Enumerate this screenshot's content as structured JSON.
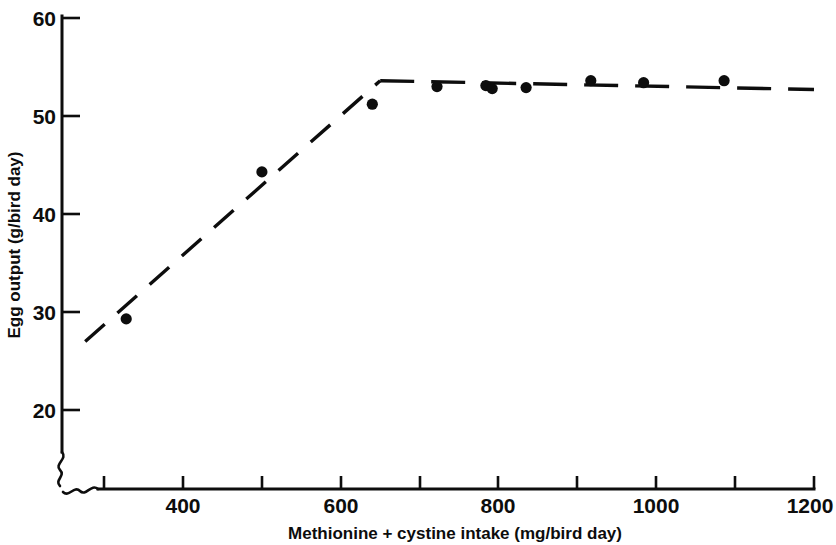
{
  "figure": {
    "title": "",
    "background_color": "#ffffff",
    "ink_color": "#0d0d0d"
  },
  "axes": {
    "x": {
      "label": "Methionine + cystine intake (mg/bird day)",
      "tick_labels": [
        "400",
        "600",
        "800",
        "1000",
        "1200"
      ],
      "labeled_ticks": [
        400,
        600,
        800,
        1000,
        1200
      ],
      "minor_ticks": [
        500,
        700,
        900,
        1100
      ],
      "range_drawn": [
        276,
        1200
      ],
      "has_axis_break": true,
      "tick_direction": "inward"
    },
    "y": {
      "label": "Egg output (g/bird day)",
      "tick_labels": [
        "20",
        "30",
        "40",
        "50",
        "60"
      ],
      "labeled_ticks": [
        20,
        30,
        40,
        50,
        60
      ],
      "range_drawn": [
        19,
        60
      ],
      "has_axis_break": true,
      "tick_direction": "inward"
    }
  },
  "chart_data": {
    "type": "scatter",
    "title": "",
    "xlabel": "Methionine + cystine intake (mg/bird day)",
    "ylabel": "Egg output (g/bird day)",
    "xlim": [
      276,
      1200
    ],
    "ylim": [
      19,
      60
    ],
    "xticks": [
      400,
      500,
      600,
      700,
      800,
      900,
      1000,
      1100,
      1200
    ],
    "xticklabels": [
      "400",
      "",
      "600",
      "",
      "800",
      "",
      "1000",
      "",
      "1200"
    ],
    "yticks": [
      20,
      30,
      40,
      50,
      60
    ],
    "yticklabels": [
      "20",
      "30",
      "40",
      "50",
      "60"
    ],
    "grid": false,
    "legend": null,
    "marker": "filled-circle",
    "series": [
      {
        "name": "Egg output observations",
        "x": [
          328,
          500,
          640,
          722,
          784,
          792,
          835,
          917,
          984,
          1086
        ],
        "y": [
          29.3,
          44.3,
          51.2,
          53.0,
          53.1,
          52.8,
          52.9,
          53.6,
          53.4,
          53.6
        ]
      }
    ],
    "fitted_model": {
      "name": "broken-line (linear plateau) fit",
      "style": "dashed",
      "breakpoint_x": 650,
      "breakpoint_y": 53.6,
      "segments": [
        {
          "name": "ascending",
          "x": [
            276,
            650
          ],
          "y": [
            27.0,
            53.6
          ]
        },
        {
          "name": "plateau",
          "x": [
            650,
            1200
          ],
          "y": [
            53.6,
            52.7
          ]
        }
      ]
    }
  }
}
